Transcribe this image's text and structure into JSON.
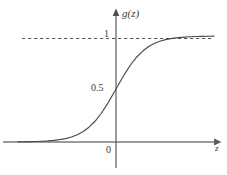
{
  "figure": {
    "name": "sigmoid-logistic-function-plot",
    "background_color": "#ffffff",
    "curve_color": "#4a4a4a",
    "axis_color": "#6e6e6e",
    "dashed_color": "#555555",
    "text_color": "#3a3a3a"
  },
  "labels": {
    "y_axis": "g(z)",
    "x_axis": "z",
    "tick_one": "1",
    "tick_half": "0.5",
    "origin": "0"
  },
  "chart_data": {
    "type": "line",
    "title": "",
    "subtitle": "",
    "xlabel": "z",
    "ylabel": "g(z)",
    "function": "g(z) = 1 / (1 + e^(-z))",
    "xlim": [
      -6.6,
      6.6
    ],
    "ylim": [
      -0.18,
      1.2
    ],
    "grid": false,
    "legend": null,
    "x_ticks": [
      0
    ],
    "x_tick_labels": [
      "0"
    ],
    "y_ticks": [
      0.5,
      1
    ],
    "y_tick_labels": [
      "0.5",
      "1"
    ],
    "annotations": [
      {
        "kind": "horizontal-asymptote",
        "value": 1,
        "style": "dashed",
        "label": "1"
      },
      {
        "kind": "y-intercept",
        "x": 0,
        "y": 0.5,
        "label": "0.5"
      }
    ],
    "series": [
      {
        "name": "g(z)",
        "x": [
          -6.6,
          -6.2,
          -5.8,
          -5.4,
          -5.0,
          -4.6,
          -4.2,
          -3.8,
          -3.4,
          -3.0,
          -2.6,
          -2.2,
          -1.8,
          -1.4,
          -1.0,
          -0.6,
          -0.2,
          0.0,
          0.2,
          0.6,
          1.0,
          1.4,
          1.8,
          2.2,
          2.6,
          3.0,
          3.4,
          3.8,
          4.2,
          4.6,
          5.0,
          5.4,
          5.8,
          6.2,
          6.6
        ],
        "values": [
          0.0014,
          0.002,
          0.003,
          0.0045,
          0.0067,
          0.01,
          0.0148,
          0.0219,
          0.0323,
          0.0474,
          0.0691,
          0.0998,
          0.1419,
          0.1978,
          0.2689,
          0.3543,
          0.4502,
          0.5,
          0.5498,
          0.6457,
          0.7311,
          0.8022,
          0.8581,
          0.9002,
          0.9309,
          0.9526,
          0.9677,
          0.9781,
          0.9852,
          0.99,
          0.9933,
          0.9955,
          0.997,
          0.998,
          0.9986
        ]
      }
    ]
  }
}
